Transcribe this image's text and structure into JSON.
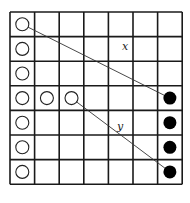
{
  "diagram": {
    "grid": {
      "rows": 7,
      "cols": 7,
      "left": 10,
      "top": 12,
      "cell": 24.6,
      "line_color": "#1a1a1a"
    },
    "open_circles": [
      {
        "row": 0,
        "col": 0
      },
      {
        "row": 1,
        "col": 0
      },
      {
        "row": 2,
        "col": 0
      },
      {
        "row": 3,
        "col": 0
      },
      {
        "row": 3,
        "col": 1
      },
      {
        "row": 3,
        "col": 2
      },
      {
        "row": 4,
        "col": 0
      },
      {
        "row": 5,
        "col": 0
      },
      {
        "row": 6,
        "col": 0
      }
    ],
    "filled_circles": [
      {
        "row": 3,
        "col": 6
      },
      {
        "row": 4,
        "col": 6
      },
      {
        "row": 5,
        "col": 6
      },
      {
        "row": 6,
        "col": 6
      }
    ],
    "lines": [
      {
        "label": "x",
        "from": {
          "row": 0,
          "col": 0
        },
        "to": {
          "row": 3,
          "col": 6
        },
        "label_pos": {
          "x": 122,
          "y": 50
        }
      },
      {
        "label": "y",
        "from": {
          "row": 3,
          "col": 2
        },
        "to": {
          "row": 6,
          "col": 6
        },
        "label_pos": {
          "x": 117,
          "y": 130
        }
      }
    ]
  }
}
